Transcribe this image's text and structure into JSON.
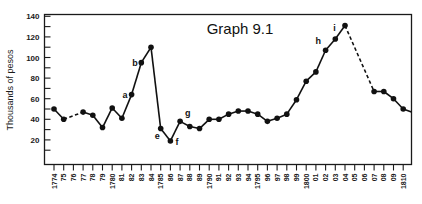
{
  "chart_data": {
    "type": "line",
    "title": "Graph 9.1",
    "xlabel": "",
    "ylabel": "Thousands of pesos",
    "ylim": [
      0,
      140
    ],
    "xlim": [
      1774,
      1810
    ],
    "y_ticks": [
      20,
      40,
      60,
      80,
      100,
      120,
      140
    ],
    "y_minor_step": 10,
    "x_tick_labels": [
      "1774",
      "75",
      "76",
      "77",
      "78",
      "79",
      "1780",
      "81",
      "82",
      "83",
      "84",
      "1785",
      "86",
      "87",
      "88",
      "89",
      "1790",
      "91",
      "92",
      "93",
      "94",
      "1795",
      "96",
      "97",
      "98",
      "99",
      "1800",
      "01",
      "02",
      "03",
      "04",
      "05",
      "06",
      "07",
      "08",
      "09",
      "1810"
    ],
    "grid": false,
    "legend": null,
    "series": [
      {
        "name": "Thousands of pesos",
        "points": [
          {
            "x": 1774,
            "y": 50
          },
          {
            "x": 1775,
            "y": 40
          },
          {
            "x": 1777,
            "y": 47
          },
          {
            "x": 1778,
            "y": 44
          },
          {
            "x": 1779,
            "y": 32
          },
          {
            "x": 1780,
            "y": 51
          },
          {
            "x": 1781,
            "y": 41
          },
          {
            "x": 1782,
            "y": 64
          },
          {
            "x": 1783,
            "y": 95
          },
          {
            "x": 1784,
            "y": 110
          },
          {
            "x": 1785,
            "y": 31
          },
          {
            "x": 1786,
            "y": 19
          },
          {
            "x": 1787,
            "y": 38
          },
          {
            "x": 1788,
            "y": 33
          },
          {
            "x": 1789,
            "y": 31
          },
          {
            "x": 1790,
            "y": 40
          },
          {
            "x": 1791,
            "y": 40
          },
          {
            "x": 1792,
            "y": 45
          },
          {
            "x": 1793,
            "y": 48
          },
          {
            "x": 1794,
            "y": 48
          },
          {
            "x": 1795,
            "y": 45
          },
          {
            "x": 1796,
            "y": 38
          },
          {
            "x": 1797,
            "y": 41
          },
          {
            "x": 1798,
            "y": 45
          },
          {
            "x": 1799,
            "y": 59
          },
          {
            "x": 1800,
            "y": 77
          },
          {
            "x": 1801,
            "y": 86
          },
          {
            "x": 1802,
            "y": 107
          },
          {
            "x": 1803,
            "y": 118
          },
          {
            "x": 1804,
            "y": 131
          },
          {
            "x": 1807,
            "y": 67
          },
          {
            "x": 1808,
            "y": 67
          },
          {
            "x": 1809,
            "y": 60
          },
          {
            "x": 1810,
            "y": 50
          }
        ],
        "trailing_to_edge": 47,
        "dashed_segments": [
          [
            1775,
            1777
          ],
          [
            1804,
            1807
          ]
        ]
      }
    ],
    "annotations": [
      {
        "label": "a",
        "x": 1782,
        "y": 64,
        "pos": "left"
      },
      {
        "label": "b",
        "x": 1783,
        "y": 95,
        "pos": "left"
      },
      {
        "label": "e",
        "x": 1785,
        "y": 31,
        "pos": "below"
      },
      {
        "label": "f",
        "x": 1786,
        "y": 19,
        "pos": "right"
      },
      {
        "label": "g",
        "x": 1787,
        "y": 38,
        "pos": "above-right"
      },
      {
        "label": "h",
        "x": 1802,
        "y": 107,
        "pos": "above-left"
      },
      {
        "label": "i",
        "x": 1803,
        "y": 118,
        "pos": "above"
      }
    ]
  }
}
